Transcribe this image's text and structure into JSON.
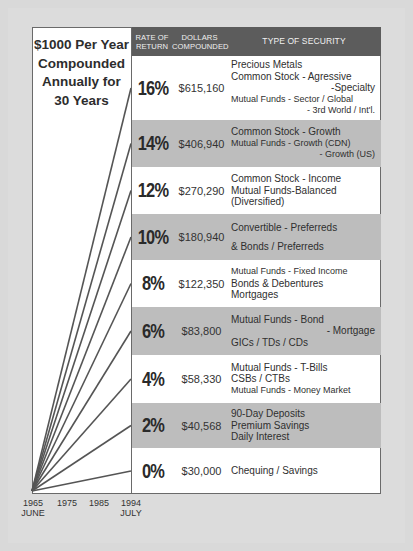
{
  "title": [
    "$1000 Per Year",
    "Compounded",
    "Annually for",
    "30 Years"
  ],
  "header": {
    "rate_line1": "RATE OF",
    "rate_line2": "RETURN",
    "dollars_line1": "DOLLARS",
    "dollars_line2": "COMPOUNDED",
    "type": "TYPE OF SECURITY"
  },
  "rows": [
    {
      "rate": "16%",
      "dollars": "$615,160",
      "shade": false,
      "lines": [
        {
          "t": "Precious Metals",
          "c": ""
        },
        {
          "t": "Common Stock - Agressive",
          "c": ""
        },
        {
          "t": "-Specialty",
          "c": "r"
        },
        {
          "t": "Mutual Funds - Sector / Global",
          "c": "sm"
        },
        {
          "t": "- 3rd World / Int'l.",
          "c": "sm r"
        }
      ]
    },
    {
      "rate": "14%",
      "dollars": "$406,940",
      "shade": true,
      "lines": [
        {
          "t": "Common Stock - Growth",
          "c": ""
        },
        {
          "t": "Mutual Funds - Growth (CDN)",
          "c": "sm"
        },
        {
          "t": "- Growth (US)",
          "c": "sm r"
        }
      ]
    },
    {
      "rate": "12%",
      "dollars": "$270,290",
      "shade": false,
      "lines": [
        {
          "t": "Common Stock - Income",
          "c": ""
        },
        {
          "t": "Mutual Funds-Balanced",
          "c": ""
        },
        {
          "t": "(Diversified)",
          "c": ""
        }
      ]
    },
    {
      "rate": "10%",
      "dollars": "$180,940",
      "shade": true,
      "lines": [
        {
          "t": "Convertible - Preferreds",
          "c": ""
        },
        {
          "t": "& Bonds / Preferreds",
          "c": "gap"
        }
      ]
    },
    {
      "rate": "8%",
      "dollars": "$122,350",
      "shade": false,
      "lines": [
        {
          "t": "Mutual Funds - Fixed Income",
          "c": "sm"
        },
        {
          "t": "Bonds & Debentures",
          "c": ""
        },
        {
          "t": "Mortgages",
          "c": ""
        }
      ]
    },
    {
      "rate": "6%",
      "dollars": "$83,800",
      "shade": true,
      "lines": [
        {
          "t": "Mutual Funds - Bond",
          "c": ""
        },
        {
          "t": "- Mortgage",
          "c": "r"
        },
        {
          "t": "GICs / TDs / CDs",
          "c": ""
        }
      ]
    },
    {
      "rate": "4%",
      "dollars": "$58,330",
      "shade": false,
      "lines": [
        {
          "t": "Mutual Funds - T-Bills",
          "c": ""
        },
        {
          "t": "CSBs / CTBs",
          "c": ""
        },
        {
          "t": "Mutual Funds - Money Market",
          "c": "sm"
        }
      ]
    },
    {
      "rate": "2%",
      "dollars": "$40,568",
      "shade": true,
      "lines": [
        {
          "t": "90-Day Deposits",
          "c": ""
        },
        {
          "t": "Premium Savings",
          "c": ""
        },
        {
          "t": "Daily Interest",
          "c": ""
        }
      ]
    },
    {
      "rate": "0%",
      "dollars": "$30,000",
      "shade": false,
      "lines": [
        {
          "t": "Chequing / Savings",
          "c": ""
        }
      ]
    }
  ],
  "x_axis": {
    "ticks": [
      "1965",
      "1975",
      "1985",
      "1994"
    ],
    "start_sub": "JUNE",
    "end_sub": "JULY"
  },
  "chart_data": {
    "type": "line",
    "title": "$1000 Per Year Compounded Annually for 30 Years",
    "xlabel": "",
    "ylabel": "Dollars Compounded",
    "x": [
      "1965 June",
      "1975",
      "1985",
      "1994 July"
    ],
    "x_ticks": [
      "1965",
      "1975",
      "1985",
      "1994"
    ],
    "grid": false,
    "legend": "none (lines labeled by table rows)",
    "series": [
      {
        "name": "16%",
        "end_value": 615160,
        "security": "Precious Metals; Common Stock - Agressive/Specialty; Mutual Funds - Sector/Global/3rd World/Int'l."
      },
      {
        "name": "14%",
        "end_value": 406940,
        "security": "Common Stock - Growth; Mutual Funds - Growth (CDN)/Growth (US)"
      },
      {
        "name": "12%",
        "end_value": 270290,
        "security": "Common Stock - Income; Mutual Funds-Balanced (Diversified)"
      },
      {
        "name": "10%",
        "end_value": 180940,
        "security": "Convertible - Preferreds & Bonds / Preferreds"
      },
      {
        "name": "8%",
        "end_value": 122350,
        "security": "Mutual Funds - Fixed Income; Bonds & Debentures; Mortgages"
      },
      {
        "name": "6%",
        "end_value": 83800,
        "security": "Mutual Funds - Bond/Mortgage; GICs / TDs / CDs"
      },
      {
        "name": "4%",
        "end_value": 58330,
        "security": "Mutual Funds - T-Bills; CSBs / CTBs; Mutual Funds - Money Market"
      },
      {
        "name": "2%",
        "end_value": 40568,
        "security": "90-Day Deposits; Premium Savings; Daily Interest"
      },
      {
        "name": "0%",
        "end_value": 30000,
        "security": "Chequing / Savings"
      }
    ],
    "table_columns": [
      "RATE OF RETURN",
      "DOLLARS COMPOUNDED",
      "TYPE OF SECURITY"
    ]
  },
  "colors": {
    "header_bg": "#5c5c5c",
    "shade_row": "#bdbdbd",
    "background": "#d9d9d9",
    "line": "#555555"
  }
}
